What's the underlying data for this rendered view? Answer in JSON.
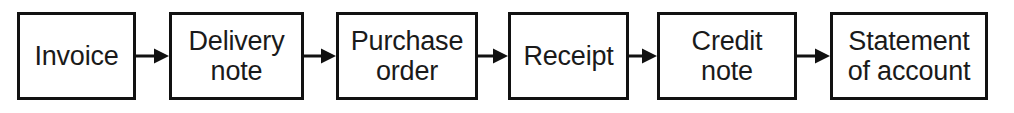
{
  "diagram": {
    "type": "linear-flowchart",
    "title": "",
    "orientation": "left-to-right",
    "background_color": "#ffffff",
    "node_border_color": "#111111",
    "node_fill_color": "#ffffff",
    "text_color": "#1a1a1a",
    "connector_color": "#111111",
    "node_count": 6,
    "connector_count": 5,
    "nodes": [
      {
        "id": "invoice",
        "label": "Invoice",
        "lines": 1,
        "x": 17,
        "y": 12,
        "width": 119,
        "height": 88
      },
      {
        "id": "delivery-note",
        "label": "Delivery\nnote",
        "lines": 2,
        "x": 169,
        "y": 12,
        "width": 135,
        "height": 88
      },
      {
        "id": "purchase-order",
        "label": "Purchase\norder",
        "lines": 2,
        "x": 336,
        "y": 12,
        "width": 142,
        "height": 88
      },
      {
        "id": "receipt",
        "label": "Receipt",
        "lines": 1,
        "x": 508,
        "y": 12,
        "width": 121,
        "height": 88
      },
      {
        "id": "credit-note",
        "label": "Credit\nnote",
        "lines": 2,
        "x": 657,
        "y": 12,
        "width": 140,
        "height": 88
      },
      {
        "id": "statement-of-account",
        "label": "Statement\nof account",
        "lines": 2,
        "x": 830,
        "y": 12,
        "width": 158,
        "height": 88
      }
    ],
    "connectors": [
      {
        "id": "invoice-to-delivery-note",
        "from": "invoice",
        "to": "delivery-note",
        "x": 136,
        "y": 45,
        "length": 33,
        "arrowhead": "solid-triangle"
      },
      {
        "id": "delivery-note-to-purchase-order",
        "from": "delivery-note",
        "to": "purchase-order",
        "x": 304,
        "y": 45,
        "length": 32,
        "arrowhead": "solid-triangle"
      },
      {
        "id": "purchase-order-to-receipt",
        "from": "purchase-order",
        "to": "receipt",
        "x": 478,
        "y": 45,
        "length": 30,
        "arrowhead": "solid-triangle"
      },
      {
        "id": "receipt-to-credit-note",
        "from": "receipt",
        "to": "credit-note",
        "x": 629,
        "y": 45,
        "length": 28,
        "arrowhead": "solid-triangle"
      },
      {
        "id": "credit-note-to-statement",
        "from": "credit-note",
        "to": "statement-of-account",
        "x": 797,
        "y": 45,
        "length": 33,
        "arrowhead": "solid-triangle"
      }
    ]
  }
}
